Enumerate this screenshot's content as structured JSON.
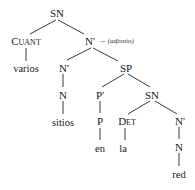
{
  "diagram": {
    "type": "syntax-tree",
    "nodes": {
      "root": {
        "label": "SN"
      },
      "quant": {
        "label": "Cuant"
      },
      "quant_leaf": {
        "label": "varios"
      },
      "nbar_top": {
        "label": "N'"
      },
      "nbar_top_annotation": {
        "arrow": "→",
        "label": "(adjunto)"
      },
      "nbar_left": {
        "label": "N'"
      },
      "n_left": {
        "label": "N"
      },
      "n_left_leaf": {
        "label": "sitios"
      },
      "sp": {
        "label": "SP"
      },
      "pbar": {
        "label": "P'"
      },
      "p": {
        "label": "P"
      },
      "p_leaf": {
        "label": "en"
      },
      "sn_inner": {
        "label": "SN"
      },
      "det": {
        "label": "Det"
      },
      "det_leaf": {
        "label": "la"
      },
      "nbar_right": {
        "label": "N'"
      },
      "n_right": {
        "label": "N"
      },
      "n_right_leaf": {
        "label": "red"
      }
    },
    "edges": [
      [
        "root",
        "quant"
      ],
      [
        "root",
        "nbar_top"
      ],
      [
        "quant",
        "quant_leaf"
      ],
      [
        "nbar_top",
        "nbar_left"
      ],
      [
        "nbar_top",
        "sp"
      ],
      [
        "nbar_left",
        "n_left"
      ],
      [
        "n_left",
        "n_left_leaf"
      ],
      [
        "sp",
        "pbar"
      ],
      [
        "sp",
        "sn_inner"
      ],
      [
        "pbar",
        "p"
      ],
      [
        "p",
        "p_leaf"
      ],
      [
        "sn_inner",
        "det"
      ],
      [
        "sn_inner",
        "nbar_right"
      ],
      [
        "det",
        "det_leaf"
      ],
      [
        "nbar_right",
        "n_right"
      ],
      [
        "n_right",
        "n_right_leaf"
      ]
    ]
  }
}
